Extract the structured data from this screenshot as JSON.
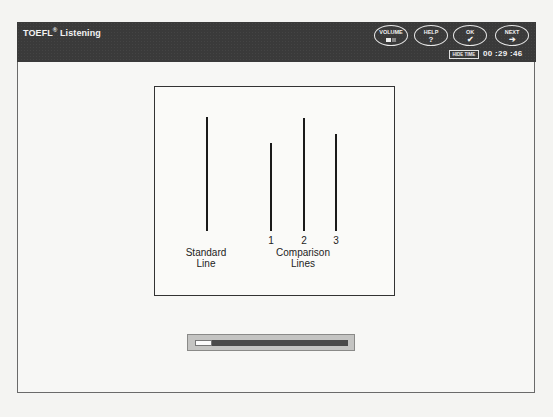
{
  "header": {
    "title": "TOEFL",
    "title_reg": "®",
    "title_suffix": " Listening",
    "buttons": [
      {
        "label": "VOLUME",
        "icon": "volume-icon"
      },
      {
        "label": "HELP",
        "icon": "?"
      },
      {
        "label": "OK",
        "icon": "✔"
      },
      {
        "label": "NEXT",
        "icon": "➔"
      }
    ],
    "hide_time_label": "HIDE TIME",
    "timer": "00 :29 :46"
  },
  "figure": {
    "standard_label_1": "Standard",
    "standard_label_2": "Line",
    "comparison_label_1": "Comparison",
    "comparison_label_2": "Lines",
    "line_numbers": [
      "1",
      "2",
      "3"
    ],
    "lines": [
      {
        "name": "standard",
        "x": 206,
        "top": 116,
        "bottom": 230
      },
      {
        "name": "1",
        "x": 270,
        "top": 142,
        "bottom": 230
      },
      {
        "name": "2",
        "x": 303,
        "top": 117,
        "bottom": 230
      },
      {
        "name": "3",
        "x": 335,
        "top": 133,
        "bottom": 230
      }
    ]
  },
  "progress": {
    "percent": 11
  }
}
